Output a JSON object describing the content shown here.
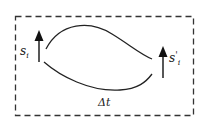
{
  "diagram": {
    "type": "state-transition",
    "frame": {
      "style": "dashed",
      "x": 15,
      "y": 16,
      "width": 179,
      "height": 100,
      "color": "#333333"
    },
    "nodes": [
      {
        "id": "s_i",
        "label_base": "s",
        "label_sub": "i",
        "label_prime": "",
        "kind": "up-arrow",
        "x": 39,
        "y_bottom": 62,
        "y_top": 32
      },
      {
        "id": "s_prime_i",
        "label_base": "s",
        "label_sub": "i",
        "label_prime": "'",
        "kind": "up-arrow",
        "x": 163,
        "y_bottom": 78,
        "y_top": 47
      }
    ],
    "edges": [
      {
        "from": "s_i",
        "to": "s_prime_i",
        "shape": "upper-curve"
      },
      {
        "from": "s_i",
        "to": "s_prime_i",
        "shape": "lower-curve"
      }
    ],
    "annotation": {
      "label": "Δt",
      "meaning": "time interval"
    },
    "colors": {
      "stroke": "#222222",
      "background": "#ffffff"
    }
  }
}
